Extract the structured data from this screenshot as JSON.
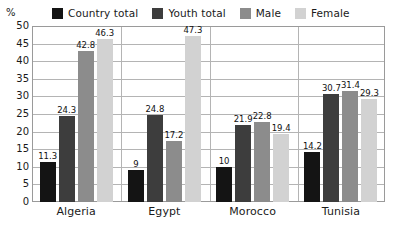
{
  "chart_data": {
    "type": "bar",
    "title": "",
    "subtitle": "",
    "xlabel": "",
    "ylabel": "%",
    "ylim": [
      0,
      50
    ],
    "yticks": [
      50,
      45,
      40,
      35,
      30,
      25,
      20,
      15,
      10,
      5,
      0
    ],
    "grid": true,
    "legend_position": "top",
    "categories": [
      "Algeria",
      "Egypt",
      "Morocco",
      "Tunisia"
    ],
    "series": [
      {
        "name": "Country total",
        "color": "#141414",
        "values": [
          11.3,
          9,
          10,
          14.2
        ],
        "labels": [
          "11.3",
          "9",
          "10",
          "14.2"
        ]
      },
      {
        "name": "Youth total",
        "color": "#3d3d3d",
        "values": [
          24.3,
          24.8,
          21.9,
          30.7
        ],
        "labels": [
          "24.3",
          "24.8",
          "21.9",
          "30.7"
        ]
      },
      {
        "name": "Male",
        "color": "#8c8c8c",
        "values": [
          42.8,
          17.2,
          22.8,
          31.4
        ],
        "labels": [
          "42.8",
          "17.2",
          "22.8",
          "31.4"
        ]
      },
      {
        "name": "Female",
        "color": "#d2d2d2",
        "values": [
          46.3,
          47.3,
          19.4,
          29.3
        ],
        "labels": [
          "46.3",
          "47.3",
          "19.4",
          "29.3"
        ]
      }
    ]
  },
  "axis": {
    "unit": "%"
  },
  "legend": {
    "items": [
      {
        "label": "Country total",
        "color": "#141414"
      },
      {
        "label": "Youth total",
        "color": "#3d3d3d"
      },
      {
        "label": "Male",
        "color": "#8c8c8c"
      },
      {
        "label": "Female",
        "color": "#d2d2d2"
      }
    ]
  },
  "colors": {
    "grid": "#b4b4b4",
    "frame": "#9a9a9a",
    "text": "#1a1a1a",
    "background": "#ffffff"
  }
}
